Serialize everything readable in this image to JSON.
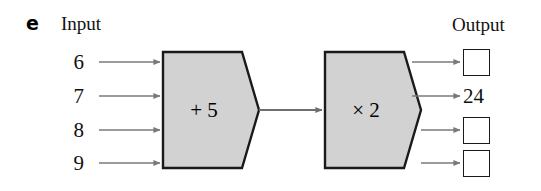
{
  "item": {
    "letter": "e"
  },
  "headings": {
    "input": "Input",
    "output": "Output"
  },
  "colors": {
    "machine_fill": "#d2d2d2",
    "machine_stroke": "#1a1a1a",
    "arrow": "#777777",
    "text": "#111111",
    "box_stroke": "#1a1a1a",
    "background": "#ffffff"
  },
  "machines": [
    {
      "name": "machine-1",
      "label": "+ 5",
      "operation": "add",
      "operand": "5"
    },
    {
      "name": "machine-2",
      "label": "× 2",
      "operation": "multiply",
      "operand": "2"
    }
  ],
  "rows": [
    {
      "input": "6",
      "output": "",
      "output_kind": "box"
    },
    {
      "input": "7",
      "output": "24",
      "output_kind": "value"
    },
    {
      "input": "8",
      "output": "",
      "output_kind": "box"
    },
    {
      "input": "9",
      "output": "",
      "output_kind": "box"
    }
  ]
}
